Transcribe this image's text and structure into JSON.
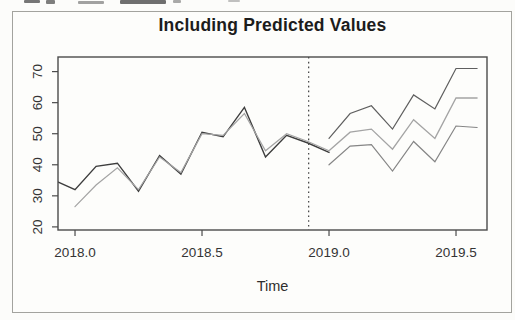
{
  "chart_data": {
    "type": "line",
    "title": "Including Predicted Values",
    "xlabel": "Time",
    "ylabel": "",
    "xlim": [
      2017.933,
      2019.622
    ],
    "ylim": [
      19.0,
      74.7
    ],
    "grid": false,
    "legend_position": "none",
    "x_ticks": [
      {
        "value": 2018.0,
        "label": "2018.0"
      },
      {
        "value": 2018.5,
        "label": "2018.5"
      },
      {
        "value": 2019.0,
        "label": "2019.0"
      },
      {
        "value": 2019.5,
        "label": "2019.5"
      }
    ],
    "y_ticks": [
      {
        "value": 20,
        "label": "20"
      },
      {
        "value": 30,
        "label": "30"
      },
      {
        "value": 40,
        "label": "40"
      },
      {
        "value": 50,
        "label": "50"
      },
      {
        "value": 60,
        "label": "60"
      },
      {
        "value": 70,
        "label": "70"
      }
    ],
    "forecast_divider_x": 2018.92,
    "divider_style": "dotted",
    "series": [
      {
        "name": "observed",
        "color": "#3d3d3d",
        "width": 1.4,
        "x": [
          2017.917,
          2018.0,
          2018.083,
          2018.167,
          2018.25,
          2018.333,
          2018.417,
          2018.5,
          2018.583,
          2018.667,
          2018.75,
          2018.833,
          2018.917,
          2019.0
        ],
        "y": [
          35,
          32,
          39.5,
          40.5,
          31.5,
          43,
          37,
          50.5,
          49,
          58.5,
          42.5,
          49.5,
          47,
          44
        ]
      },
      {
        "name": "fitted",
        "color": "#a4a4a4",
        "width": 1.2,
        "x": [
          2018.0,
          2018.083,
          2018.167,
          2018.25,
          2018.333,
          2018.417,
          2018.5,
          2018.583,
          2018.667,
          2018.75,
          2018.833,
          2018.917,
          2019.0
        ],
        "y": [
          26.5,
          33.5,
          39,
          32,
          42.5,
          37.5,
          50,
          49.5,
          56.5,
          44.5,
          50,
          47.5,
          44.5
        ]
      },
      {
        "name": "forecast-upper",
        "color": "#5f5f5f",
        "width": 1.2,
        "x": [
          2019.0,
          2019.083,
          2019.167,
          2019.25,
          2019.333,
          2019.417,
          2019.5,
          2019.583
        ],
        "y": [
          48.5,
          56.5,
          59,
          51.5,
          62.5,
          58,
          71,
          71
        ]
      },
      {
        "name": "forecast-mean",
        "color": "#a4a4a4",
        "width": 1.3,
        "x": [
          2019.0,
          2019.083,
          2019.167,
          2019.25,
          2019.333,
          2019.417,
          2019.5,
          2019.583
        ],
        "y": [
          44.5,
          50.5,
          51.5,
          45,
          54.5,
          48.5,
          61.5,
          61.5
        ]
      },
      {
        "name": "forecast-lower",
        "color": "#858585",
        "width": 1.2,
        "x": [
          2019.0,
          2019.083,
          2019.167,
          2019.25,
          2019.333,
          2019.417,
          2019.5,
          2019.583
        ],
        "y": [
          40,
          46,
          46.5,
          38,
          47.5,
          41,
          52.5,
          52
        ]
      }
    ]
  }
}
